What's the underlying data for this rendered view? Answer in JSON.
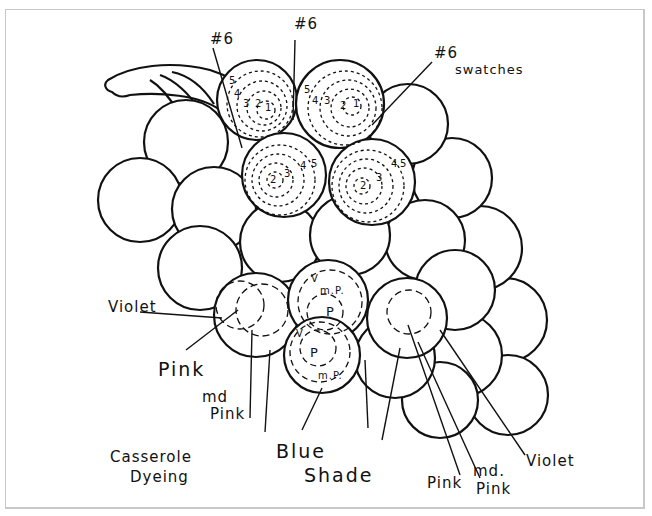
{
  "diagram": {
    "stroke_color": "#111111",
    "frame_color": "#c8c8c8",
    "labels": {
      "top_left_swatch": "#6",
      "top_center_swatch": "#6",
      "top_right_swatch": "#6",
      "swatches": "swatches",
      "violet_left": "Violet",
      "pink_left": "Pink",
      "md_pink_left_1": "md",
      "md_pink_left_2": "Pink",
      "casserole_1": "Casserole",
      "casserole_2": "Dyeing",
      "blue_shade_1": "Blue",
      "blue_shade_2": "Shade",
      "pink_right": "Pink",
      "md_pink_right_1": "md.",
      "md_pink_right_2": "Pink",
      "violet_right": "Violet"
    },
    "grape_numbers": {
      "g1": [
        "5",
        "4",
        "3",
        "2",
        "1"
      ],
      "g2": [
        "5",
        "4",
        "3",
        "2",
        "1"
      ],
      "g3": [
        "2",
        "3",
        "4",
        "5"
      ],
      "g4": [
        "2",
        "3",
        "4",
        "5"
      ]
    },
    "blue_grape_marks": {
      "upper_mp": "m.P.",
      "upper_p": "P",
      "upper_v": "V",
      "lower_p": "P",
      "lower_mp": "m.P.",
      "lower_v": "V"
    }
  }
}
